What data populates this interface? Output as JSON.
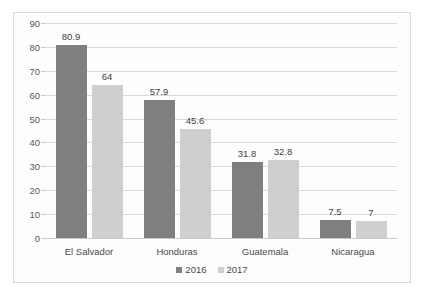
{
  "chart_data": {
    "type": "bar",
    "title": "",
    "subtitle": "",
    "xlabel": "",
    "ylabel": "",
    "categories": [
      "El Salvador",
      "Honduras",
      "Guatemala",
      "Nicaragua"
    ],
    "series": [
      {
        "name": "2016",
        "color": "#7f7f7f",
        "values": [
          80.9,
          57.9,
          31.8,
          7.5
        ],
        "labels": [
          "80.9",
          "57.9",
          "31.8",
          "7.5"
        ]
      },
      {
        "name": "2017",
        "color": "#cfcfcf",
        "values": [
          64,
          45.6,
          32.8,
          7
        ],
        "labels": [
          "64",
          "45.6",
          "32.8",
          "7"
        ]
      }
    ],
    "ylim": [
      0,
      90
    ],
    "ytick_step": 10,
    "yticks": [
      "0",
      "10",
      "20",
      "30",
      "40",
      "50",
      "60",
      "70",
      "80",
      "90"
    ],
    "grid": true,
    "legend_position": "bottom-center",
    "data_labels": true
  },
  "frame": {
    "border_color": "#dcdcdc",
    "background": "#fdfdfd"
  }
}
